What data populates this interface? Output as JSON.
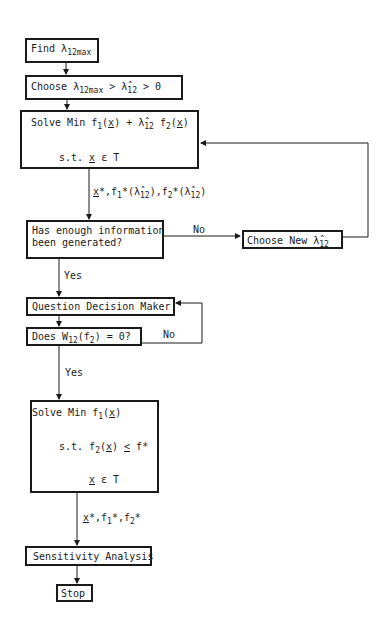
{
  "flowchart": {
    "nodes": [
      {
        "id": "find",
        "text": "Find λ12max",
        "prefix": "Find λ",
        "sub": "12max"
      },
      {
        "id": "choose",
        "prefix": "Choose λ",
        "sub1": "12max",
        "mid": " > λ̂",
        "sub2": "12",
        "suffix": " > 0"
      },
      {
        "id": "solve1",
        "line1_a": "Solve Min f",
        "line1_b": "1",
        "line1_c": "(",
        "line1_x": "x",
        "line1_d": ") + λ̂",
        "line1_e": "12",
        "line1_f": " f",
        "line1_g": "2",
        "line1_h": "(",
        "line1_i": "x",
        "line1_j": ")",
        "line2_a": "s.t. ",
        "line2_x": "x",
        "line2_b": " ε T"
      },
      {
        "id": "enough",
        "line1": "Has enough information",
        "line2": "been generated?"
      },
      {
        "id": "choose_new",
        "prefix": "Choose New λ̂",
        "sub": "12"
      },
      {
        "id": "question",
        "text": "Question Decision Maker"
      },
      {
        "id": "does",
        "a": "Does W",
        "sub1": "12",
        "b": "(f",
        "sub2": "2",
        "c": ") = 0?"
      },
      {
        "id": "solve2",
        "l1a": "Solve Min f",
        "l1s": "1",
        "l1b": "(",
        "l1x": "x",
        "l1c": ")",
        "l2a": "s.t. f",
        "l2s": "2",
        "l2b": "(",
        "l2x": "x",
        "l2c": ") ",
        "l2le": "<",
        "l2d": " f*",
        "l3x": "x",
        "l3b": " ε T"
      },
      {
        "id": "sensitivity",
        "text": "Sensitivity Analysis"
      },
      {
        "id": "stop",
        "text": "Stop"
      }
    ],
    "edge_labels": {
      "out1_x": "x",
      "out1_a": "*,f",
      "out1_s1": "1",
      "out1_b": "*(λ̂",
      "out1_s2": "12",
      "out1_c": "),f",
      "out1_s3": "2",
      "out1_d": "*(λ̂",
      "out1_s4": "12",
      "out1_e": ")",
      "no1": "No",
      "yes1": "Yes",
      "no2": "No",
      "yes2": "Yes",
      "out2_x": "x",
      "out2_a": "*,f",
      "out2_s1": "1",
      "out2_b": "*,f",
      "out2_s2": "2",
      "out2_c": "*"
    }
  }
}
